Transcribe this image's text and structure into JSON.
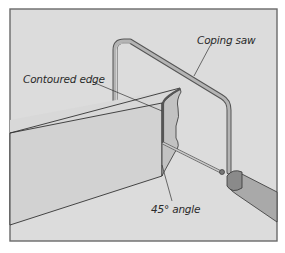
{
  "figure": {
    "colors": {
      "background": "#dcdcdc",
      "border": "#6a6a6a",
      "molding_face": "#d4d4d4",
      "molding_side": "#cfcfcf",
      "cut_face": "#c4c4c4",
      "saw_frame": "#9a9a9a",
      "handle": "#a8a8a8",
      "line": "#333333"
    },
    "labels": {
      "coping_saw": "Coping saw",
      "contoured_edge": "Contoured edge",
      "angle": "45° angle"
    }
  }
}
